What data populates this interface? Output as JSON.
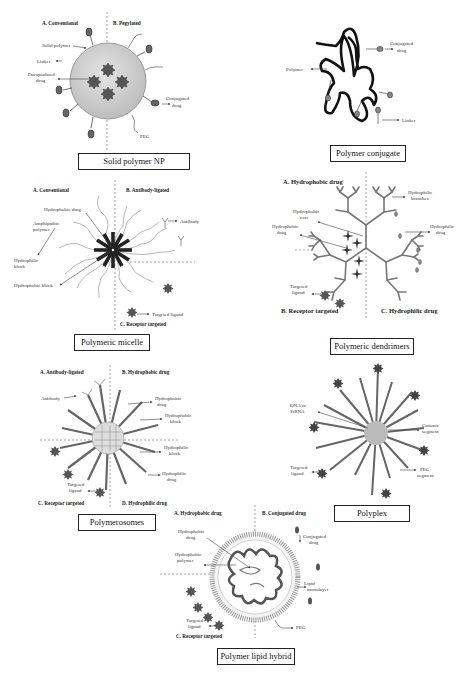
{
  "panels": {
    "solid_np": {
      "caption": "Solid polymer NP",
      "head_a": "A. Conventional",
      "head_b": "B. Pegylated",
      "labels": [
        "Solid polymer",
        "Linker",
        "Encapsulated",
        "drug",
        "Conjugated",
        "drug",
        "PEG"
      ]
    },
    "conjugate": {
      "caption": "Polymer conjugate",
      "labels": [
        "Conjugated",
        "drug",
        "Polymer",
        "Linker"
      ]
    },
    "micelle": {
      "caption": "Polymeric micelle",
      "head_a": "A. Conventional",
      "head_b": "B. Antibody-ligated",
      "head_c": "C. Receptor targeted",
      "labels": [
        "Hydrophobic drug",
        "Amphipathic",
        "polymer",
        "Hydrophilic",
        "block",
        "Hydrophobic block",
        "Antibody",
        "Targeted ligand"
      ]
    },
    "dendrimers": {
      "caption": "Polymeric dendrimers",
      "head_a": "A. Hydrophobic drug",
      "head_b": "B. Receptor targeted",
      "head_c": "C. Hydrophilic drug",
      "labels": [
        "Hydrophilic",
        "branches",
        "Hydrophobic",
        "core",
        "Hydrophobic",
        "drug",
        "Hydrophilic",
        "drug",
        "Targeted",
        "ligand"
      ]
    },
    "polymersomes": {
      "caption": "Polymerosomes",
      "head_a": "A. Antibody-ligated",
      "head_b": "B. Hydrophobic drug",
      "head_c": "C. Receptor targeted",
      "head_d": "D. Hydrophilic drug",
      "labels": [
        "Antibody",
        "Hydrophobic",
        "drug",
        "Hydrophobic",
        "block",
        "Hydrophilic",
        "block",
        "Hydrophilic",
        "drug",
        "Targeted",
        "ligand"
      ]
    },
    "polyplex": {
      "caption": "Polyplex",
      "labels": [
        "DNA or",
        "SiRNA",
        "Cationic",
        "segment",
        "Targeted",
        "ligand",
        "PEG",
        "segment"
      ]
    },
    "lipid_hybrid": {
      "caption": "Polymer lipid hybrid",
      "head_a": "A. Hydrophobic drug",
      "head_b": "B. Conjugated drug",
      "head_c": "C. Receptor targeted",
      "labels": [
        "Hydrophobic",
        "drug",
        "Hydrophobic",
        "polymer",
        "Conjugated",
        "drug",
        "Lipid",
        "monolayer",
        "Targeted",
        "ligand",
        "PEG"
      ]
    }
  }
}
